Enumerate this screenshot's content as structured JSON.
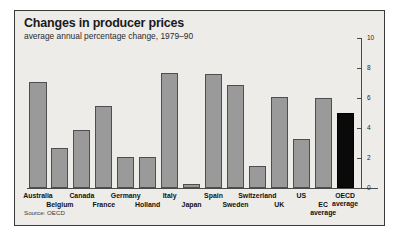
{
  "chart_data": {
    "type": "bar",
    "title": "Changes in producer prices",
    "subtitle": "average annual percentage change, 1979–90",
    "source": "Source: OECD",
    "xlabel": "",
    "ylabel": "",
    "ylim": [
      0,
      10
    ],
    "yticks": [
      0,
      2,
      4,
      6,
      8,
      10
    ],
    "ytick_labels": [
      "0",
      "2",
      "4",
      "6",
      "8",
      "10"
    ],
    "grid": false,
    "legend": null,
    "axis_position": "right",
    "categories": [
      "Australia",
      "Belgium",
      "Canada",
      "France",
      "Germany",
      "Holland",
      "Italy",
      "Japan",
      "Spain",
      "Sweden",
      "Switzerland",
      "UK",
      "US",
      "EC average",
      "OECD average"
    ],
    "category_lines": [
      [
        "Australia"
      ],
      [
        "Belgium"
      ],
      [
        "Canada"
      ],
      [
        "France"
      ],
      [
        "Germany"
      ],
      [
        "Holland"
      ],
      [
        "Italy"
      ],
      [
        "Japan"
      ],
      [
        "Spain"
      ],
      [
        "Sweden"
      ],
      [
        "Switzerland"
      ],
      [
        "UK"
      ],
      [
        "US"
      ],
      [
        "EC",
        "average"
      ],
      [
        "OECD",
        "average"
      ]
    ],
    "label_rows": [
      0,
      1,
      0,
      1,
      0,
      1,
      0,
      1,
      0,
      1,
      0,
      1,
      0,
      1,
      0
    ],
    "values": [
      7.1,
      2.7,
      3.9,
      5.5,
      2.1,
      2.1,
      7.7,
      0.3,
      7.6,
      6.9,
      1.5,
      6.1,
      3.3,
      6.0,
      5.0
    ],
    "highlight_index": 14,
    "colors": {
      "bar_fill": "#9a9a9a",
      "bar_stroke": "#4e4e4e",
      "highlight_fill": "#0a0a0a",
      "background": "#eeece9",
      "frame": "#3a3a3a",
      "text": "#111111"
    }
  }
}
